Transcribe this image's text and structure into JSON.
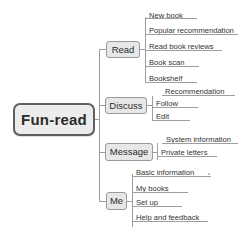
{
  "diagram": {
    "type": "mind-map",
    "root": {
      "label": "Fun-read"
    },
    "colors": {
      "node_fill": "#e9e9e9",
      "node_border": "#8e8e8e",
      "root_border": "#5f5f5f",
      "line": "#9e9e9e",
      "text": "#333333",
      "background": "#ffffff"
    },
    "branches": [
      {
        "label": "Read",
        "children": [
          {
            "label": "New book"
          },
          {
            "label": "Popular recommendation"
          },
          {
            "label": "Read book reviews"
          },
          {
            "label": "Book scan"
          },
          {
            "label": "Bookshelf"
          }
        ]
      },
      {
        "label": "Discuss",
        "children": [
          {
            "label": "Recommendation"
          },
          {
            "label": "Follow"
          },
          {
            "label": "Edit"
          }
        ]
      },
      {
        "label": "Message",
        "children": [
          {
            "label": "System information"
          },
          {
            "label": "Private letters"
          }
        ]
      },
      {
        "label": "Me",
        "children": [
          {
            "label": "Basic information"
          },
          {
            "label": "My books"
          },
          {
            "label": "Set up"
          },
          {
            "label": "Help and feedback"
          }
        ]
      }
    ]
  }
}
